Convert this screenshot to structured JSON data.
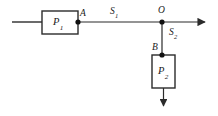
{
  "diagram": {
    "stroke_color": "#2b2b2b",
    "node_color": "#111111",
    "box_fill": "#ffffff",
    "background": "#ffffff",
    "boxes": [
      {
        "id": "box-p1",
        "label_main": "P",
        "label_sub": "1",
        "x": 42,
        "y": 11,
        "width": 36,
        "height": 23
      },
      {
        "id": "box-p2",
        "label_main": "P",
        "label_sub": "2",
        "x": 152,
        "y": 55,
        "width": 23,
        "height": 33
      }
    ],
    "nodes": [
      {
        "id": "node-a",
        "label": "A",
        "x": 78,
        "y": 22
      },
      {
        "id": "node-o",
        "label": "O",
        "x": 162,
        "y": 22
      },
      {
        "id": "node-b",
        "label": "B",
        "x": 162,
        "y": 55
      }
    ],
    "segments": [
      {
        "id": "segment-s1",
        "label_main": "S",
        "label_sub": "1"
      },
      {
        "id": "segment-s2",
        "label_main": "S",
        "label_sub": "2"
      }
    ],
    "labels": {
      "a": "A",
      "o": "O",
      "b": "B",
      "s1_main": "S",
      "s1_sub": "1",
      "s2_main": "S",
      "s2_sub": "2",
      "p1_main": "P",
      "p1_sub": "1",
      "p2_main": "P",
      "p2_sub": "2"
    }
  }
}
